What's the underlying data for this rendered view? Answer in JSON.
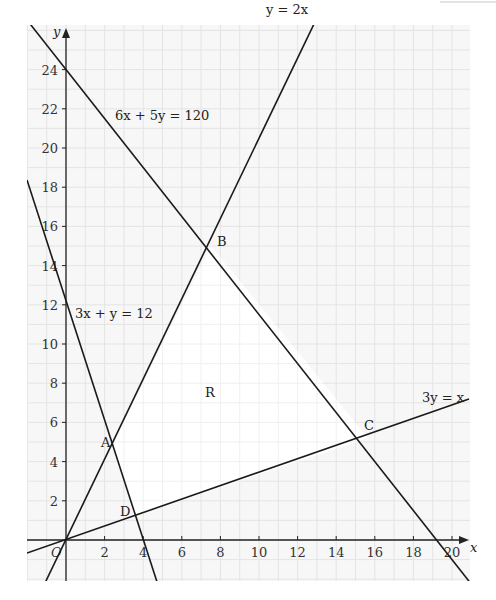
{
  "chart_data": {
    "type": "line",
    "title": "",
    "xlabel": "x",
    "ylabel": "y",
    "xlim": [
      -2,
      21
    ],
    "ylim": [
      -2.3,
      26.3
    ],
    "grid": true,
    "grid_step": 1,
    "origin_label": "O",
    "x_ticks": [
      2,
      4,
      6,
      8,
      10,
      12,
      14,
      16,
      18,
      20
    ],
    "y_ticks": [
      2,
      4,
      6,
      8,
      10,
      12,
      14,
      16,
      18,
      20,
      22,
      24
    ],
    "lines": [
      {
        "name": "6x + 5y = 120",
        "equation": "6x + 5y = 120",
        "x": [
          -2,
          21.67
        ],
        "y": [
          26.4,
          -2
        ]
      },
      {
        "name": "y = 2x",
        "equation": "y = 2x",
        "x": [
          -1.1,
          13.1
        ],
        "y": [
          -2.2,
          26.3
        ]
      },
      {
        "name": "3x + y = 12",
        "equation": "3x + y = 12",
        "x": [
          -2,
          4.77
        ],
        "y": [
          18,
          -2.3
        ]
      },
      {
        "name": "3y = x",
        "equation": "3y = x",
        "x": [
          -2,
          20.9
        ],
        "y": [
          -0.67,
          6.97
        ]
      }
    ],
    "points": [
      {
        "label": "A",
        "x": 2.4,
        "y": 4.8
      },
      {
        "label": "B",
        "x": 7.5,
        "y": 15
      },
      {
        "label": "C",
        "x": 15.65,
        "y": 5.22
      },
      {
        "label": "D",
        "x": 3.6,
        "y": 1.2
      }
    ],
    "region": {
      "label": "R",
      "vertices": [
        "A",
        "B",
        "C",
        "D"
      ],
      "shading": "unshaded (feasible region)"
    },
    "annotations": [
      "6x + 5y = 120",
      "y = 2x",
      "3x + y = 12",
      "3y = x",
      "R",
      "A",
      "B",
      "C",
      "D",
      "O"
    ],
    "legend": "none"
  },
  "labels": {
    "y_axis": "y",
    "x_axis": "x",
    "origin": "O",
    "eq1": "6x + 5y = 120",
    "eq2": "y = 2x",
    "eq3": "3x + y = 12",
    "eq4": "3y = x",
    "region": "R",
    "A": "A",
    "B": "B",
    "C": "C",
    "D": "D",
    "xt": [
      "2",
      "4",
      "6",
      "8",
      "10",
      "12",
      "14",
      "16",
      "18",
      "20"
    ],
    "yt": [
      "2",
      "4",
      "6",
      "8",
      "10",
      "12",
      "14",
      "16",
      "18",
      "20",
      "22",
      "24"
    ]
  },
  "colors": {
    "background": "#f7f7f7",
    "grid": "#e4e4e4",
    "region": "#ffffff",
    "lines": "#1a1a1a"
  }
}
